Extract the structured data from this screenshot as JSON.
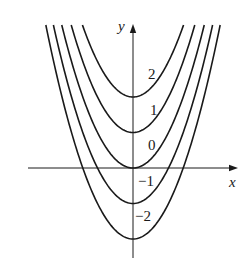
{
  "chart_data": {
    "type": "line",
    "title": "",
    "xlabel": "x",
    "ylabel": "y",
    "series": [
      {
        "name": "2",
        "c": 2,
        "label": "2"
      },
      {
        "name": "1",
        "c": 1,
        "label": "1"
      },
      {
        "name": "0",
        "c": 0,
        "label": "0"
      },
      {
        "name": "-1",
        "c": -1,
        "label": "−1"
      },
      {
        "name": "-2",
        "c": -2,
        "label": "−2"
      }
    ],
    "xlim": [
      -3,
      3
    ],
    "ylim": [
      -2.5,
      4
    ],
    "grid": false,
    "legend": "inline labels near right branch of each curve",
    "tick_labels": false
  },
  "colors": {
    "curve": "#1a1a1a",
    "axis": "#1a1a1a",
    "background": "#ffffff"
  },
  "layout": {
    "origin_px": [
      133,
      168
    ],
    "px_per_unit": 35.5,
    "clip_top_px": 25,
    "x_axis_px": [
      28,
      238
    ],
    "y_axis_px": [
      24,
      258
    ]
  }
}
